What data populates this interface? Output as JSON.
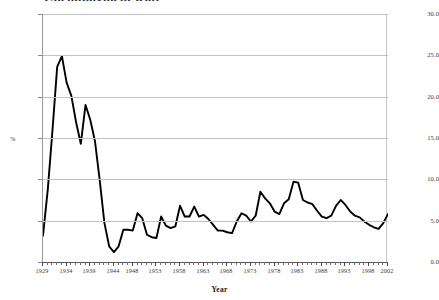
{
  "chart_title": "Unemployment Rate",
  "axis": {
    "y_label": "%",
    "x_label": "Year",
    "y_ticks": [
      "0.0",
      "5.0",
      "10.0",
      "15.0",
      "20.0",
      "25.0",
      "30.0"
    ],
    "x_ticks": [
      "1929",
      "1934",
      "1939",
      "1944",
      "1948",
      "1953",
      "1958",
      "1963",
      "1968",
      "1973",
      "1978",
      "1983",
      "1988",
      "1993",
      "1998",
      "2002"
    ]
  },
  "colors": {
    "line": "#000000",
    "grid": "#c2c2c2",
    "axis": "#5a5a5a",
    "text": "#3a3a3a",
    "background": "#ffffff"
  },
  "chart_data": {
    "type": "line",
    "title": "Unemployment Rate",
    "xlabel": "Year",
    "ylabel": "%",
    "ylim": [
      0.0,
      30.0
    ],
    "xlim": [
      1929,
      2002
    ],
    "grid": true,
    "legend": null,
    "ytick_values": [
      0.0,
      5.0,
      10.0,
      15.0,
      20.0,
      25.0,
      30.0
    ],
    "xtick_values": [
      1929,
      1934,
      1939,
      1944,
      1948,
      1953,
      1958,
      1963,
      1968,
      1973,
      1978,
      1983,
      1988,
      1993,
      1998,
      2002
    ],
    "series": [
      {
        "name": "Unemployment Rate",
        "x": [
          1929,
          1930,
          1931,
          1932,
          1933,
          1934,
          1935,
          1936,
          1937,
          1938,
          1939,
          1940,
          1941,
          1942,
          1943,
          1944,
          1945,
          1946,
          1947,
          1948,
          1949,
          1950,
          1951,
          1952,
          1953,
          1954,
          1955,
          1956,
          1957,
          1958,
          1959,
          1960,
          1961,
          1962,
          1963,
          1964,
          1965,
          1966,
          1967,
          1968,
          1969,
          1970,
          1971,
          1972,
          1973,
          1974,
          1975,
          1976,
          1977,
          1978,
          1979,
          1980,
          1981,
          1982,
          1983,
          1984,
          1985,
          1986,
          1987,
          1988,
          1989,
          1990,
          1991,
          1992,
          1993,
          1994,
          1995,
          1996,
          1997,
          1998,
          1999,
          2000,
          2001,
          2002
        ],
        "values": [
          3.2,
          8.7,
          15.9,
          23.6,
          24.9,
          21.7,
          20.1,
          16.9,
          14.3,
          19.0,
          17.2,
          14.6,
          9.9,
          4.7,
          1.9,
          1.2,
          1.9,
          3.9,
          3.9,
          3.8,
          5.9,
          5.3,
          3.3,
          3.0,
          2.9,
          5.5,
          4.4,
          4.1,
          4.3,
          6.8,
          5.5,
          5.5,
          6.7,
          5.5,
          5.7,
          5.2,
          4.5,
          3.8,
          3.8,
          3.6,
          3.5,
          4.9,
          5.9,
          5.6,
          4.9,
          5.6,
          8.5,
          7.7,
          7.1,
          6.1,
          5.8,
          7.1,
          7.6,
          9.7,
          9.6,
          7.5,
          7.2,
          7.0,
          6.2,
          5.5,
          5.3,
          5.6,
          6.8,
          7.5,
          6.9,
          6.1,
          5.6,
          5.4,
          4.9,
          4.5,
          4.2,
          4.0,
          4.7,
          5.8
        ]
      }
    ]
  }
}
